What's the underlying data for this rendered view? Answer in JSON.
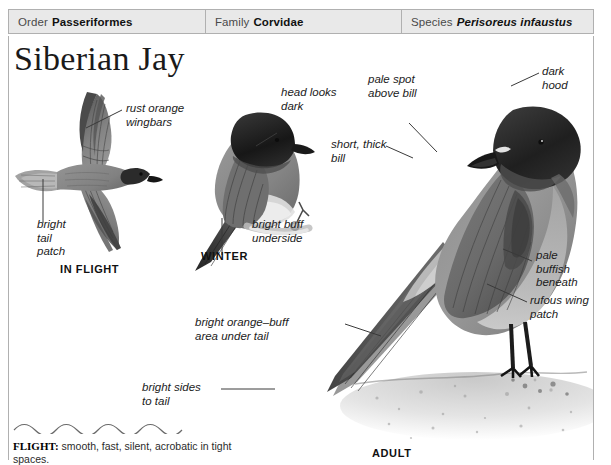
{
  "taxonomy": {
    "order_key": "Order",
    "order_value": "Passeriformes",
    "family_key": "Family",
    "family_value": "Corvidae",
    "species_key": "Species",
    "species_value": "Perisoreus infaustus"
  },
  "title": "Siberian Jay",
  "plates": {
    "in_flight_caption": "IN FLIGHT",
    "winter_caption": "WINTER",
    "adult_caption": "ADULT"
  },
  "labels": {
    "rust_orange_wingbars": "rust orange\nwingbars",
    "bright_tail_patch": "bright\ntail\npatch",
    "head_looks_dark": "head looks\ndark",
    "bright_buff_underside": "bright buff\nunderside",
    "pale_spot_above_bill": "pale spot\nabove bill",
    "dark_hood": "dark hood",
    "short_thick_bill": "short, thick\nbill",
    "pale_buffish_beneath": "pale buffish\nbeneath",
    "rufous_wing_patch": "rufous wing\npatch",
    "bright_orange_buff_under_tail": "bright orange–buff\narea under tail",
    "bright_sides_to_tail": "bright sides\nto tail"
  },
  "flight": {
    "heading": "FLIGHT:",
    "description": " smooth, fast, silent, acrobatic in tight spaces."
  },
  "colors": {
    "header_background": "#e9e9e9",
    "border": "#b0b0b0",
    "text": "#1b1b1b",
    "bird_body": "#8e8e8e",
    "bird_hood": "#2a2a2a",
    "bird_wing": "#6e6e6e",
    "ground": "#d8d8d8"
  }
}
